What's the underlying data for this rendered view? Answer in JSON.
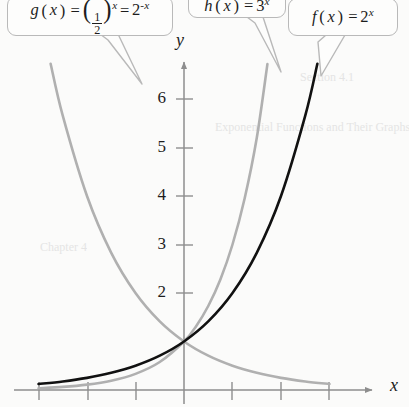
{
  "figure": {
    "background_color": "#fbfbfa",
    "axis_color": "#8e8e8e",
    "width": 409,
    "height": 407
  },
  "axes": {
    "x_label": "x",
    "y_label": "y",
    "origin_px": [
      184,
      390
    ],
    "unit_px": 48.5,
    "x_tick_positions_px": [
      39,
      88,
      136,
      232,
      281,
      329
    ],
    "y_tick_labels": [
      "6",
      "5",
      "4",
      "3",
      "2"
    ],
    "y_tick_values": [
      6,
      5,
      4,
      3,
      2
    ],
    "y_tick_positions_px": [
      99,
      148,
      196,
      245,
      293
    ]
  },
  "callouts": {
    "g": {
      "name": "g-function-callout",
      "fn": "g",
      "base_fraction": {
        "numerator": "1",
        "denominator": "2"
      },
      "exponent": "x",
      "equals": "=",
      "alt_base": "2",
      "alt_exponent": "-x",
      "text": "g(x) = (1/2)^x = 2^-x"
    },
    "h": {
      "name": "h-function-callout",
      "fn": "h",
      "base": "3",
      "exponent": "x",
      "text": "h(x) = 3^x"
    },
    "f": {
      "name": "f-function-callout",
      "fn": "f",
      "base": "2",
      "exponent": "x",
      "text": "f(x) = 2^x"
    }
  },
  "chart_data": {
    "type": "line",
    "title": "",
    "xlabel": "x",
    "ylabel": "y",
    "xlim": [
      -3.0,
      4.0
    ],
    "ylim": [
      -0.1,
      6.85
    ],
    "grid": false,
    "legend": "callout-labels",
    "common_point": [
      0,
      1
    ],
    "series": [
      {
        "name": "f(x) = 2^x",
        "expression": "2^x",
        "color": "#111111",
        "width": 2.6,
        "x": [
          -3,
          -2.5,
          -2,
          -1.5,
          -1,
          -0.5,
          0,
          0.5,
          1,
          1.5,
          2,
          2.5,
          2.75
        ],
        "y": [
          0.125,
          0.177,
          0.25,
          0.354,
          0.5,
          0.707,
          1,
          1.414,
          2,
          2.828,
          4,
          5.657,
          6.727
        ]
      },
      {
        "name": "h(x) = 3^x",
        "expression": "3^x",
        "color": "#b0b0b0",
        "width": 2.6,
        "x": [
          -3,
          -2.5,
          -2,
          -1.5,
          -1,
          -0.5,
          0,
          0.25,
          0.5,
          0.75,
          1,
          1.25,
          1.5,
          1.72
        ],
        "y": [
          0.037,
          0.064,
          0.111,
          0.192,
          0.333,
          0.577,
          1,
          1.316,
          1.732,
          2.28,
          3,
          3.948,
          5.196,
          6.72
        ]
      },
      {
        "name": "g(x) = (1/2)^x = 2^-x",
        "expression": "2^-x",
        "color": "#b0b0b0",
        "width": 2.6,
        "x": [
          -2.75,
          -2.5,
          -2,
          -1.5,
          -1,
          -0.5,
          0,
          0.5,
          1,
          1.5,
          2,
          2.5,
          3
        ],
        "y": [
          6.727,
          5.657,
          4,
          2.828,
          2,
          1.414,
          1,
          0.707,
          0.5,
          0.354,
          0.25,
          0.177,
          0.125
        ]
      }
    ]
  },
  "artifacts": {
    "a1": "Section 4.1",
    "a2": "Exponential Functions and Their Graphs",
    "a3": "Chapter 4"
  }
}
